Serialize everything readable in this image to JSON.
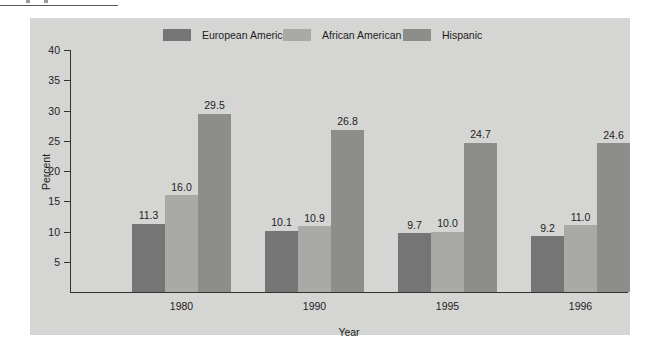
{
  "chart_data": {
    "type": "bar",
    "title": "",
    "subtitle": "",
    "xlabel": "Year",
    "ylabel": "Percent",
    "categories": [
      "1980",
      "1990",
      "1995",
      "1996"
    ],
    "series": [
      {
        "name": "European American",
        "color": "#757575",
        "values": [
          11.3,
          10.1,
          9.7,
          9.2
        ],
        "labels": [
          "11.3",
          "10.1",
          "9.7",
          "9.2"
        ]
      },
      {
        "name": "African American",
        "color": "#a9a9a6",
        "values": [
          16.0,
          10.9,
          10.0,
          11.0
        ],
        "labels": [
          "16.0",
          "10.9",
          "10.0",
          "11.0"
        ]
      },
      {
        "name": "Hispanic",
        "color": "#8d8d8a",
        "values": [
          29.5,
          26.8,
          24.7,
          24.6
        ],
        "labels": [
          "29.5",
          "26.8",
          "24.7",
          "24.6"
        ]
      }
    ],
    "ylim": [
      0,
      40
    ],
    "yticks": [
      5,
      10,
      15,
      20,
      25,
      30,
      35,
      40
    ],
    "ytick_labels": [
      "5",
      "10",
      "15",
      "20",
      "25",
      "30",
      "35",
      "40"
    ],
    "grid": false,
    "legend_position": "top",
    "panel_background": "#d5d5d3",
    "axis_color": "#35352f",
    "text_color": "#1d1d1d"
  },
  "legend": {
    "items": [
      {
        "label": "European American",
        "color": "#757575"
      },
      {
        "label": "African American",
        "color": "#a9a9a6"
      },
      {
        "label": "Hispanic",
        "color": "#8d8d8a"
      }
    ]
  },
  "axes": {
    "y_title": "Percent",
    "x_title": "Year",
    "y_ticks": [
      "40",
      "35",
      "30",
      "25",
      "20",
      "15",
      "10",
      "5"
    ],
    "x_ticks": [
      "1980",
      "1990",
      "1995",
      "1996"
    ]
  }
}
